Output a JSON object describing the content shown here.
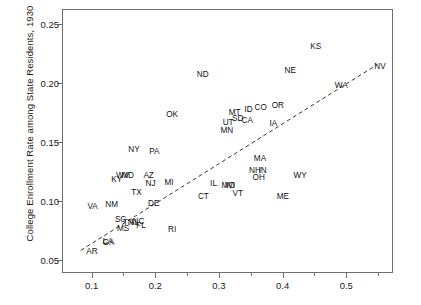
{
  "chart_data": {
    "type": "scatter",
    "title": "",
    "xlabel": "",
    "ylabel": "College Enrollment Rate among State Residents, 1930",
    "xlim": [
      0.055,
      0.575
    ],
    "ylim": [
      0.038,
      0.262
    ],
    "grid": false,
    "legend": null,
    "point_marker": "state-abbreviation-text",
    "xticks": [
      0.1,
      0.2,
      0.3,
      0.4,
      0.5
    ],
    "xticklabels": [
      "0.1",
      "0.2",
      "0.3",
      "0.4",
      "0.5"
    ],
    "xminorticks": [
      0.15,
      0.25,
      0.35,
      0.45,
      0.55
    ],
    "yticks": [
      0.05,
      0.1,
      0.15,
      0.2,
      0.25
    ],
    "yticklabels": [
      "0.05",
      "0.10",
      "0.15",
      "0.20",
      "0.25"
    ],
    "annotations": [
      {
        "label": "NV",
        "x": 0.553,
        "y": 0.2135
      },
      {
        "label": "KS",
        "x": 0.452,
        "y": 0.2305
      },
      {
        "label": "NE",
        "x": 0.412,
        "y": 0.2105
      },
      {
        "label": "WA",
        "x": 0.492,
        "y": 0.1975
      },
      {
        "label": "ND",
        "x": 0.2745,
        "y": 0.2065
      },
      {
        "label": "OR",
        "x": 0.3925,
        "y": 0.1805
      },
      {
        "label": "CO",
        "x": 0.3655,
        "y": 0.1785
      },
      {
        "label": "ID",
        "x": 0.3465,
        "y": 0.1775
      },
      {
        "label": "MT",
        "x": 0.3245,
        "y": 0.1745
      },
      {
        "label": "SD",
        "x": 0.3295,
        "y": 0.1695
      },
      {
        "label": "CA",
        "x": 0.3445,
        "y": 0.1675
      },
      {
        "label": "UT",
        "x": 0.3145,
        "y": 0.1665
      },
      {
        "label": "IA",
        "x": 0.3855,
        "y": 0.1655
      },
      {
        "label": "OK",
        "x": 0.2265,
        "y": 0.1725
      },
      {
        "label": "MN",
        "x": 0.3125,
        "y": 0.1595
      },
      {
        "label": "PA",
        "x": 0.1985,
        "y": 0.1415
      },
      {
        "label": "NY",
        "x": 0.1665,
        "y": 0.1435
      },
      {
        "label": "MA",
        "x": 0.3645,
        "y": 0.1355
      },
      {
        "label": "NH",
        "x": 0.3565,
        "y": 0.1255
      },
      {
        "label": "IN",
        "x": 0.3685,
        "y": 0.1255
      },
      {
        "label": "OH",
        "x": 0.3625,
        "y": 0.1195
      },
      {
        "label": "WY",
        "x": 0.4275,
        "y": 0.1215
      },
      {
        "label": "AZ",
        "x": 0.1895,
        "y": 0.1215
      },
      {
        "label": "NJ",
        "x": 0.1925,
        "y": 0.1145
      },
      {
        "label": "MD",
        "x": 0.1565,
        "y": 0.1215
      },
      {
        "label": "WV",
        "x": 0.1485,
        "y": 0.1215
      },
      {
        "label": "KY",
        "x": 0.1395,
        "y": 0.1175
      },
      {
        "label": "MI",
        "x": 0.2215,
        "y": 0.1155
      },
      {
        "label": "IL",
        "x": 0.2915,
        "y": 0.1145
      },
      {
        "label": "MO",
        "x": 0.3145,
        "y": 0.1125
      },
      {
        "label": "WI",
        "x": 0.3175,
        "y": 0.1125
      },
      {
        "label": "VT",
        "x": 0.3295,
        "y": 0.1055
      },
      {
        "label": "CT",
        "x": 0.2755,
        "y": 0.1035
      },
      {
        "label": "ME",
        "x": 0.4005,
        "y": 0.1035
      },
      {
        "label": "TX",
        "x": 0.1705,
        "y": 0.1065
      },
      {
        "label": "DE",
        "x": 0.1975,
        "y": 0.0975
      },
      {
        "label": "NM",
        "x": 0.1315,
        "y": 0.0965
      },
      {
        "label": "VA",
        "x": 0.1015,
        "y": 0.0945
      },
      {
        "label": "SC",
        "x": 0.1455,
        "y": 0.0835
      },
      {
        "label": "TN",
        "x": 0.1575,
        "y": 0.0815
      },
      {
        "label": "AL",
        "x": 0.1665,
        "y": 0.0815
      },
      {
        "label": "NC",
        "x": 0.1735,
        "y": 0.0825
      },
      {
        "label": "FL",
        "x": 0.1775,
        "y": 0.0785
      },
      {
        "label": "MS",
        "x": 0.1495,
        "y": 0.0765
      },
      {
        "label": "RI",
        "x": 0.2265,
        "y": 0.0755
      },
      {
        "label": "LA",
        "x": 0.1255,
        "y": 0.0655
      },
      {
        "label": "GA",
        "x": 0.1265,
        "y": 0.0645
      },
      {
        "label": "AR",
        "x": 0.1005,
        "y": 0.0565
      }
    ],
    "fit_line": {
      "style": "dashed",
      "color": "#333333",
      "x0": 0.083,
      "y0": 0.0565,
      "x1": 0.552,
      "y1": 0.2155
    }
  }
}
